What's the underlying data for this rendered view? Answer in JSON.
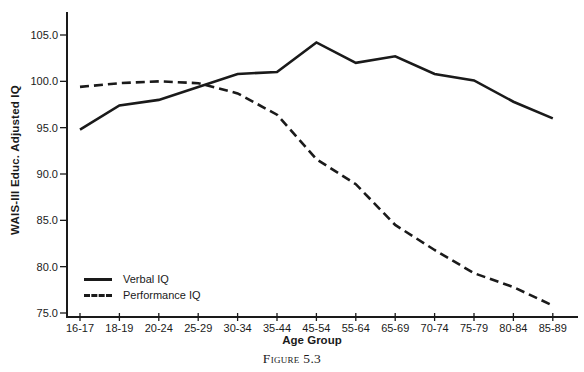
{
  "figure": {
    "caption": "Figure 5.3"
  },
  "chart_data": {
    "type": "line",
    "title": "",
    "xlabel": "Age Group",
    "ylabel": "WAIS-III Educ. Adjusted IQ",
    "categories": [
      "16-17",
      "18-19",
      "20-24",
      "25-29",
      "30-34",
      "35-44",
      "45-54",
      "55-64",
      "65-69",
      "70-74",
      "75-79",
      "80-84",
      "85-89"
    ],
    "series": [
      {
        "name": "Verbal IQ",
        "line_style": "solid",
        "values": [
          94.8,
          97.4,
          98.0,
          99.4,
          100.8,
          101.0,
          104.2,
          102.0,
          102.7,
          100.8,
          100.1,
          97.8,
          96.0
        ]
      },
      {
        "name": "Performance IQ",
        "line_style": "dashed",
        "values": [
          99.4,
          99.8,
          100.0,
          99.8,
          98.7,
          96.4,
          91.6,
          88.9,
          84.5,
          81.8,
          79.3,
          77.8,
          75.8
        ]
      }
    ],
    "ylim": [
      75,
      105
    ],
    "yticks": {
      "values": [
        75,
        80,
        85,
        90,
        95,
        100,
        105
      ],
      "labels": [
        "75.0",
        "80.0",
        "85.0",
        "90.0",
        "95.0",
        "100.0",
        "105.0"
      ]
    },
    "grid": false,
    "legend_position": "lower-left",
    "line_color": "#1a1a1a",
    "background_color": "#ffffff"
  }
}
